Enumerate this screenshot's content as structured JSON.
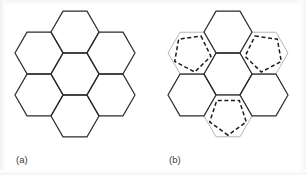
{
  "figure": {
    "caption_a": "(a)",
    "caption_b": "(b)",
    "background_color": "#ffffff",
    "solid_stroke_color": "#2b2b2b",
    "gray_stroke_color": "#aeaeae",
    "dashed_stroke_color": "#1c1c1c",
    "solid_stroke_width": 1.2,
    "gray_stroke_width": 0.9,
    "dashed_stroke_width": 1.5,
    "dash_pattern": "4,2.6"
  },
  "chart_data": {
    "type": "diagram",
    "title": "",
    "subtitle": "",
    "xlabel": "",
    "ylabel": "",
    "grid": false,
    "legend_position": "none",
    "panels": [
      {
        "id": "a",
        "label": "(a)",
        "label_x": 16,
        "label_y": 163,
        "description": "honeycomb cluster of seven regular hexagons, all solid black outline",
        "hex_radius": 24.0,
        "center_x": 75,
        "center_y": 74,
        "hex_orientation": "flat-top",
        "cells": [
          {
            "name": "center",
            "cx": 75,
            "cy": 74,
            "style": "solid",
            "pentagon": false
          },
          {
            "name": "top",
            "cx": 75,
            "cy": 32,
            "style": "solid",
            "pentagon": false
          },
          {
            "name": "upper-left",
            "cx": 39,
            "cy": 53,
            "style": "solid",
            "pentagon": false
          },
          {
            "name": "upper-right",
            "cx": 111,
            "cy": 53,
            "style": "solid",
            "pentagon": false
          },
          {
            "name": "lower-left",
            "cx": 39,
            "cy": 95,
            "style": "solid",
            "pentagon": false
          },
          {
            "name": "lower-right",
            "cx": 111,
            "cy": 95,
            "style": "solid",
            "pentagon": false
          },
          {
            "name": "bottom",
            "cx": 75,
            "cy": 116,
            "style": "solid",
            "pentagon": false
          }
        ]
      },
      {
        "id": "b",
        "label": "(b)",
        "label_x": 169,
        "label_y": 163,
        "description": "same seven-hexagon honeycomb cluster; three alternating outer cells drawn in light gray with black dashed pentagons inscribed",
        "hex_radius": 24.0,
        "center_x": 228,
        "center_y": 74,
        "hex_orientation": "flat-top",
        "cells": [
          {
            "name": "center",
            "cx": 228,
            "cy": 74,
            "style": "solid",
            "pentagon": false
          },
          {
            "name": "top",
            "cx": 228,
            "cy": 32,
            "style": "solid",
            "pentagon": false
          },
          {
            "name": "upper-left",
            "cx": 192,
            "cy": 53,
            "style": "gray",
            "pentagon": true,
            "pentagon_rotation": 28
          },
          {
            "name": "upper-right",
            "cx": 264,
            "cy": 53,
            "style": "gray",
            "pentagon": true,
            "pentagon_rotation": -28
          },
          {
            "name": "lower-left",
            "cx": 192,
            "cy": 95,
            "style": "solid",
            "pentagon": false
          },
          {
            "name": "lower-right",
            "cx": 264,
            "cy": 95,
            "style": "solid",
            "pentagon": false
          },
          {
            "name": "bottom",
            "cx": 228,
            "cy": 116,
            "style": "gray",
            "pentagon": true,
            "pentagon_rotation": 180
          }
        ]
      }
    ]
  }
}
